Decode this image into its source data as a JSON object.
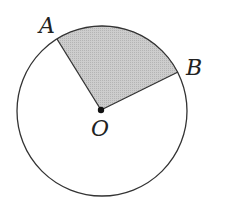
{
  "diagram": {
    "type": "circle-sector",
    "circle": {
      "cx": 102,
      "cy": 111,
      "r": 85,
      "stroke": "#333333"
    },
    "center_point": {
      "label": "O",
      "x": 101,
      "y": 110
    },
    "points": [
      {
        "label": "A",
        "x": 57,
        "y": 39
      },
      {
        "label": "B",
        "x": 178,
        "y": 72
      }
    ],
    "shaded_sector": {
      "from": "A",
      "to": "B",
      "fill": "#c4c4c4"
    },
    "labels": {
      "A": "A",
      "B": "B",
      "O": "O"
    }
  }
}
